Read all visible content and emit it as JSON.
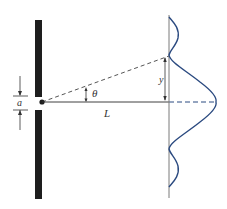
{
  "diagram": {
    "labels": {
      "slit_width": "a",
      "angle": "θ",
      "distance": "L",
      "displacement": "y"
    },
    "colors": {
      "ink": "#2a2a2a",
      "intensity_curve": "#2b4a80",
      "screen": "#7a7a7a",
      "background": "#ffffff"
    },
    "elements": {
      "barrier": "opaque barrier with narrow slit of width a",
      "screen": "vertical viewing screen at distance L",
      "intensity_pattern": "diffraction intensity profile with central maximum and side lobes",
      "ray": "dashed ray from slit at angle θ hitting screen at height y"
    }
  }
}
